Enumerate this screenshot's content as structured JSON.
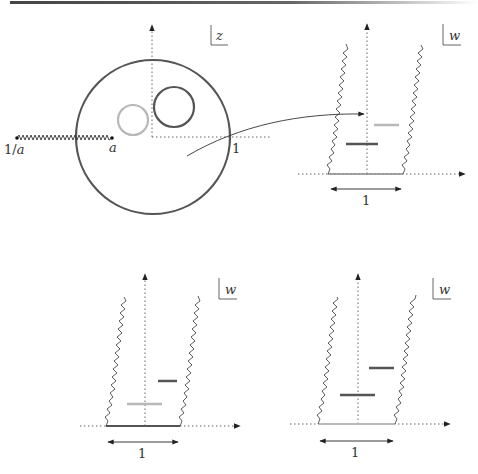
{
  "colors": {
    "dark": "#555555",
    "light": "#b8b8b8",
    "axis": "#666666",
    "ink": "#222222"
  },
  "panels": {
    "z_plane": {
      "plane_label": "z",
      "cut_left_label": "1/a",
      "cut_right_label": "a",
      "unit_label": "1"
    },
    "w_plane_top": {
      "plane_label": "w",
      "width_label": "1"
    },
    "w_plane_bottom_left": {
      "plane_label": "w",
      "width_label": "1"
    },
    "w_plane_bottom_right": {
      "plane_label": "w",
      "width_label": "1"
    }
  }
}
